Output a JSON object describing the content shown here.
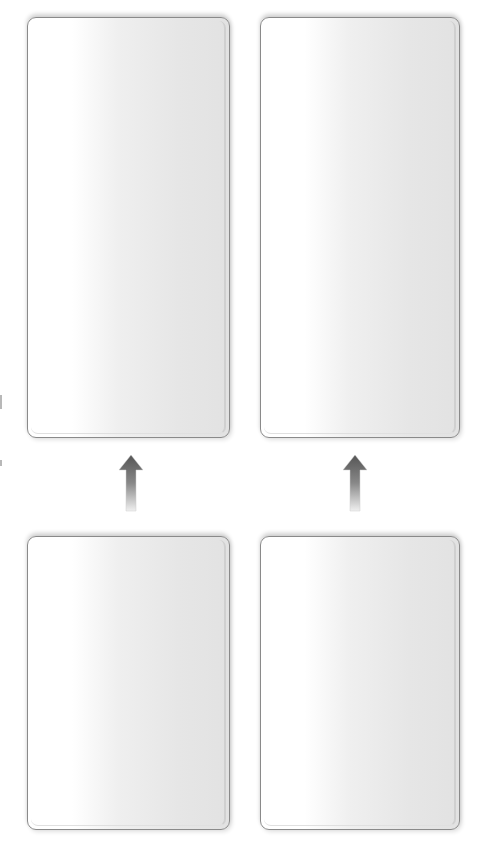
{
  "diagram": {
    "panels": [
      {
        "id": "top-left",
        "label": ""
      },
      {
        "id": "top-right",
        "label": ""
      },
      {
        "id": "bottom-left",
        "label": ""
      },
      {
        "id": "bottom-right",
        "label": ""
      }
    ],
    "arrows": [
      {
        "from": "bottom-left",
        "to": "top-left",
        "direction": "up"
      },
      {
        "from": "bottom-right",
        "to": "top-right",
        "direction": "up"
      }
    ],
    "colors": {
      "panel_border": "#8a8a8a",
      "panel_fill_light": "#ffffff",
      "panel_fill_dark": "#e2e2e2",
      "arrow_dark": "#555555",
      "arrow_light": "#e8e8e8"
    }
  }
}
